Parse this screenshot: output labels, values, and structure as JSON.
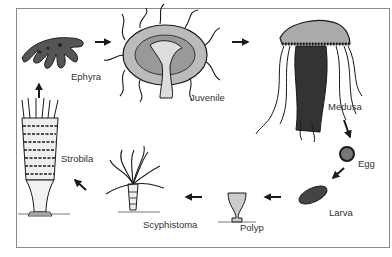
{
  "diagram": {
    "type": "life-cycle",
    "stages": [
      {
        "id": "ephyra",
        "label": "Ephyra"
      },
      {
        "id": "juvenile",
        "label": "Juvenile"
      },
      {
        "id": "medusa",
        "label": "Medusa"
      },
      {
        "id": "egg",
        "label": "Egg"
      },
      {
        "id": "larva",
        "label": "Larva"
      },
      {
        "id": "polyp",
        "label": "Polyp"
      },
      {
        "id": "scyphistoma",
        "label": "Scyphistoma"
      },
      {
        "id": "strobila",
        "label": "Strobila"
      }
    ],
    "flow": [
      [
        "ephyra",
        "juvenile"
      ],
      [
        "juvenile",
        "medusa"
      ],
      [
        "medusa",
        "egg"
      ],
      [
        "egg",
        "larva"
      ],
      [
        "larva",
        "polyp"
      ],
      [
        "polyp",
        "scyphistoma"
      ],
      [
        "scyphistoma",
        "strobila"
      ],
      [
        "strobila",
        "ephyra"
      ]
    ],
    "colors": {
      "frame": "#8a8a8a",
      "ink": "#1a1a1a",
      "label": "#333333",
      "fill_light": "#c8c8c8",
      "fill_mid": "#8f8f8f"
    }
  }
}
